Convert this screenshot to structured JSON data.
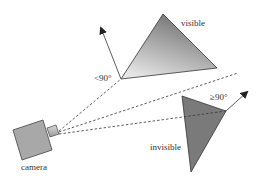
{
  "labels": {
    "visible": "visible",
    "invisible": "invisible",
    "camera": "camera",
    "angle_visible": "<90°",
    "angle_invisible": "≥90°"
  },
  "colors": {
    "triangle_visible_dark": "#6e6e6e",
    "triangle_visible_light": "#e2e2e2",
    "triangle_invisible": "#7a7a7a",
    "camera_body": "#a8a8a8",
    "lens": "#bdbdbd",
    "line": "#333333"
  }
}
